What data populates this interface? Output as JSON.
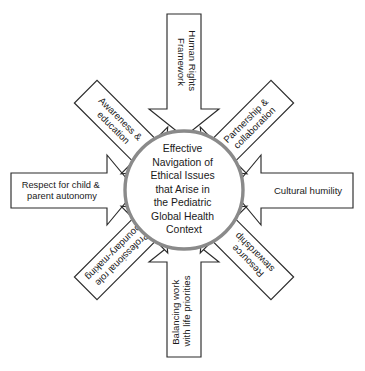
{
  "diagram": {
    "title_center": {
      "name": "hub-label",
      "lines": [
        "Effective",
        "Navigation of",
        "Ethical Issues",
        "that Arise in",
        "the Pediatric",
        "Global Health",
        "Context"
      ],
      "full_text": "Effective Navigation of Ethical Issues that Arise in the Pediatric Global Health Context"
    },
    "colors": {
      "background": "#ffffff",
      "arrow_fill": "#ffffff",
      "arrow_stroke": "#2b2b2b",
      "ring_stroke": "#8a8a8a",
      "text": "#1a1a1a"
    },
    "arrows": [
      {
        "id": "human-rights-framework",
        "position": "top",
        "direction": "down",
        "rotation": 90,
        "lines": [
          "Human Rights",
          "Framework"
        ],
        "full_text": "Human Rights Framework"
      },
      {
        "id": "partnership-collaboration",
        "position": "top-right",
        "direction": "down-left",
        "rotation": -45,
        "lines": [
          "Partnership &",
          "collaboration"
        ],
        "full_text": "Partnership & collaboration"
      },
      {
        "id": "cultural-humility",
        "position": "right",
        "direction": "left",
        "rotation": 0,
        "lines": [
          "Cultural humility"
        ],
        "full_text": "Cultural humility"
      },
      {
        "id": "resource-stewardship",
        "position": "bottom-right",
        "direction": "up-left",
        "rotation": 45,
        "lines": [
          "Resource",
          "stewardship"
        ],
        "full_text": "Resource stewardship"
      },
      {
        "id": "balancing-work-life",
        "position": "bottom",
        "direction": "up",
        "rotation": -90,
        "lines": [
          "Balancing work",
          "with life priorities"
        ],
        "full_text": "Balancing work with life priorities"
      },
      {
        "id": "professional-role-boundary-making",
        "position": "bottom-left",
        "direction": "up-right",
        "rotation": -45,
        "lines": [
          "Professional role",
          "boundary-making"
        ],
        "full_text": "Professional role boundary-making"
      },
      {
        "id": "respect-child-parent-autonomy",
        "position": "left",
        "direction": "right",
        "rotation": 0,
        "lines": [
          "Respect for child &",
          "parent autonomy"
        ],
        "full_text": "Respect for child & parent autonomy"
      },
      {
        "id": "awareness-education",
        "position": "top-left",
        "direction": "down-right",
        "rotation": 45,
        "lines": [
          "Awareness &",
          "education"
        ],
        "full_text": "Awareness & education"
      }
    ]
  }
}
